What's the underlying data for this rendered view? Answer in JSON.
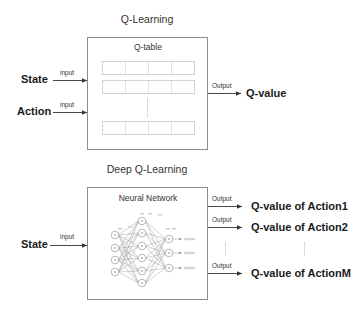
{
  "q_learning": {
    "title": "Q-Learning",
    "box_title": "Q-table",
    "inputs": [
      {
        "label": "State",
        "arrow_label": "input"
      },
      {
        "label": "Action",
        "arrow_label": "input"
      }
    ],
    "output": {
      "arrow_label": "Output",
      "label": "Q-value"
    },
    "table_rows_visible": 3,
    "table_columns": 4,
    "ellipsis": "vertical-dots"
  },
  "deep_q_learning": {
    "title": "Deep Q-Learning",
    "box_title": "Neural Network",
    "inputs": [
      {
        "label": "State",
        "arrow_label": "input"
      }
    ],
    "outputs": [
      {
        "arrow_label": "Output",
        "label": "Q-value of Action1"
      },
      {
        "arrow_label": "Output",
        "label": "Q-value of Action2"
      },
      {
        "arrow_label": "Output",
        "label": "Q-value of ActionM"
      }
    ],
    "network": {
      "layers": [
        4,
        6,
        3
      ],
      "layer_names": [
        "input",
        "hidden",
        "output"
      ]
    },
    "ellipsis": "vertical-dots"
  },
  "colors": {
    "box_border": "#8c8c8c",
    "table_border": "#d2d2d2",
    "arrow": "#333333",
    "text": "#1a1a1a"
  }
}
